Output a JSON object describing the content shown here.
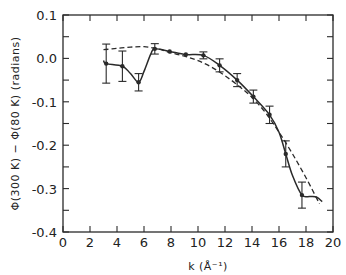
{
  "chart_data": {
    "type": "line",
    "title": "",
    "xlabel": "k (Å⁻¹)",
    "ylabel": "Φ(300 K) − Φ(80 K)  (radians)",
    "xlim": [
      0,
      20
    ],
    "ylim": [
      -0.4,
      0.1
    ],
    "grid": false,
    "x_ticks": [
      0,
      2,
      4,
      6,
      8,
      10,
      12,
      14,
      16,
      18,
      20
    ],
    "y_ticks": [
      0.1,
      0.0,
      -0.1,
      -0.2,
      -0.3,
      -0.4
    ],
    "y_tick_labels": [
      "0.1",
      "0.0",
      "-0.1",
      "-0.2",
      "-0.3",
      "-0.4"
    ],
    "series": [
      {
        "name": "measured (solid, with error bars)",
        "style": "solid",
        "points": [
          {
            "k": 3.2,
            "phi": -0.012,
            "err": 0.045
          },
          {
            "k": 4.4,
            "phi": -0.018,
            "err": 0.035
          },
          {
            "k": 5.6,
            "phi": -0.055,
            "err": 0.02
          },
          {
            "k": 6.8,
            "phi": 0.022,
            "err": 0.012
          },
          {
            "k": 7.9,
            "phi": 0.016,
            "err": 0.0
          },
          {
            "k": 9.1,
            "phi": 0.009,
            "err": 0.0
          },
          {
            "k": 10.4,
            "phi": 0.007,
            "err": 0.008
          },
          {
            "k": 11.6,
            "phi": -0.016,
            "err": 0.015
          },
          {
            "k": 12.9,
            "phi": -0.05,
            "err": 0.015
          },
          {
            "k": 14.1,
            "phi": -0.088,
            "err": 0.015
          },
          {
            "k": 15.3,
            "phi": -0.13,
            "err": 0.02
          },
          {
            "k": 16.5,
            "phi": -0.22,
            "err": 0.03
          },
          {
            "k": 17.7,
            "phi": -0.315,
            "err": 0.03
          }
        ],
        "curve": [
          [
            3.0,
            -0.005
          ],
          [
            3.2,
            -0.012
          ],
          [
            4.4,
            -0.018
          ],
          [
            5.0,
            -0.035
          ],
          [
            5.6,
            -0.055
          ],
          [
            6.0,
            -0.03
          ],
          [
            6.5,
            0.01
          ],
          [
            6.8,
            0.022
          ],
          [
            7.9,
            0.016
          ],
          [
            9.1,
            0.009
          ],
          [
            10.4,
            0.007
          ],
          [
            11.6,
            -0.016
          ],
          [
            12.9,
            -0.05
          ],
          [
            14.1,
            -0.088
          ],
          [
            15.3,
            -0.13
          ],
          [
            16.0,
            -0.17
          ],
          [
            16.5,
            -0.22
          ],
          [
            17.0,
            -0.27
          ],
          [
            17.7,
            -0.315
          ],
          [
            18.3,
            -0.318
          ],
          [
            18.8,
            -0.32
          ],
          [
            19.2,
            -0.33
          ]
        ]
      },
      {
        "name": "fit (dashed)",
        "style": "dashed",
        "curve": [
          [
            3.0,
            0.02
          ],
          [
            4,
            0.023
          ],
          [
            5,
            0.026
          ],
          [
            6,
            0.027
          ],
          [
            7,
            0.022
          ],
          [
            8,
            0.013
          ],
          [
            9,
            0.005
          ],
          [
            10,
            -0.005
          ],
          [
            11,
            -0.02
          ],
          [
            12,
            -0.04
          ],
          [
            13,
            -0.063
          ],
          [
            14,
            -0.09
          ],
          [
            15,
            -0.125
          ],
          [
            16,
            -0.17
          ],
          [
            17,
            -0.22
          ],
          [
            18,
            -0.275
          ],
          [
            19,
            -0.335
          ]
        ]
      }
    ]
  }
}
